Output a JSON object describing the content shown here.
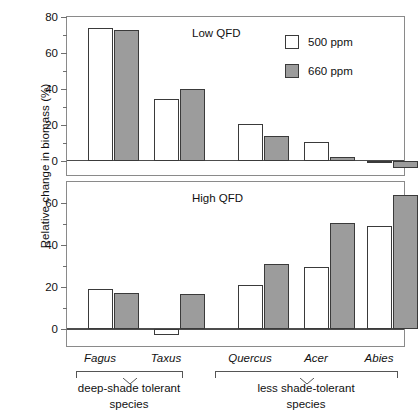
{
  "chart_data": {
    "type": "bar",
    "title": "",
    "xlabel": "",
    "ylabel": "Relative change in biomass (%)",
    "grid": false,
    "legend_position": "top-right",
    "categories": [
      "Fagus",
      "Taxus",
      "Quercus",
      "Acer",
      "Abies"
    ],
    "panels": [
      {
        "label": "Low QFD",
        "ylim": [
          -8,
          80
        ],
        "yticks": [
          0,
          20,
          40,
          60,
          80
        ],
        "ytick_labels": [
          "0",
          "20",
          "40",
          "60",
          "80"
        ],
        "yminor": [
          10,
          30,
          50,
          70
        ],
        "series": [
          {
            "name": "500 ppm",
            "fill": "open",
            "values": [
              74,
              34.5,
              20.5,
              10.5,
              -1
            ]
          },
          {
            "name": "660 ppm",
            "fill": "filled",
            "values": [
              73,
              40,
              14,
              2,
              -4
            ]
          }
        ]
      },
      {
        "label": "High QFD",
        "ylim": [
          -8,
          70
        ],
        "yticks": [
          0,
          20,
          40,
          60
        ],
        "ytick_labels": [
          "0",
          "20",
          "40",
          "60"
        ],
        "yminor": [
          10,
          30,
          50
        ],
        "series": [
          {
            "name": "500 ppm",
            "fill": "open",
            "values": [
              19,
              -3,
              21,
              29.5,
              49
            ]
          },
          {
            "name": "660 ppm",
            "fill": "filled",
            "values": [
              17,
              16.5,
              31,
              50.5,
              64
            ]
          }
        ]
      }
    ],
    "legend": [
      {
        "label": "500 ppm",
        "fill": "open",
        "color": "#ffffff"
      },
      {
        "label": "660 ppm",
        "fill": "filled",
        "color": "#9c9c9c"
      }
    ],
    "groups": [
      {
        "caption_line1": "deep-shade tolerant",
        "caption_line2": "species",
        "members": [
          "Fagus",
          "Taxus"
        ]
      },
      {
        "caption_line1": "less shade-tolerant",
        "caption_line2": "species",
        "members": [
          "Quercus",
          "Acer",
          "Abies"
        ]
      }
    ]
  },
  "axis": {
    "ylabel": "Relative change in biomass (%)"
  },
  "panel_top": {
    "title": "Low QFD",
    "tick_80": "80",
    "tick_60": "60",
    "tick_40": "40",
    "tick_20": "20",
    "tick_0": "0"
  },
  "panel_bottom": {
    "title": "High QFD",
    "tick_60": "60",
    "tick_40": "40",
    "tick_20": "20",
    "tick_0": "0"
  },
  "legend": {
    "item0_label": "500 ppm",
    "item1_label": "660 ppm"
  },
  "species": {
    "fagus": "Fagus",
    "taxus": "Taxus",
    "quercus": "Quercus",
    "acer": "Acer",
    "abies": "Abies"
  },
  "groups": {
    "left_line1": "deep-shade tolerant",
    "left_line2": "species",
    "right_line1": "less shade-tolerant",
    "right_line2": "species"
  }
}
